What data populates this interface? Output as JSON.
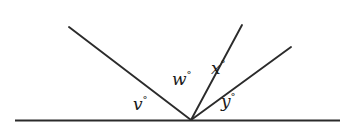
{
  "figure": {
    "type": "angle-diagram",
    "background_color": "#ffffff",
    "line_color": "#2b2b2b",
    "text_color": "#1a1a1a"
  },
  "labels": {
    "v": {
      "text": "v",
      "degree_symbol": "°"
    },
    "w": {
      "text": "w",
      "degree_symbol": "°"
    },
    "x": {
      "text": "x",
      "degree_symbol": "°"
    },
    "y": {
      "text": "y",
      "degree_symbol": "°"
    }
  },
  "chart_data": {
    "type": "diagram",
    "title": "",
    "vertex": {
      "x": 191,
      "y": 120
    },
    "baseline": {
      "x1": 15,
      "y1": 120.5,
      "x2": 340,
      "y2": 120.5
    },
    "rays": [
      {
        "name": "ray-upper-left",
        "x1": 191,
        "y1": 120,
        "x2": 69,
        "y2": 27,
        "bearing_deg": 142.7
      },
      {
        "name": "ray-steep-up-right",
        "x1": 191,
        "y1": 120,
        "x2": 242,
        "y2": 25,
        "bearing_deg": 61.8
      },
      {
        "name": "ray-shallow-up-right",
        "x1": 191,
        "y1": 120,
        "x2": 291,
        "y2": 47,
        "bearing_deg": 36.1
      }
    ],
    "angles": [
      {
        "label": "v",
        "between": [
          "baseline-left",
          "ray-upper-left"
        ],
        "value_deg": 37.3
      },
      {
        "label": "w",
        "between": [
          "ray-upper-left",
          "ray-steep-up-right"
        ],
        "value_deg": 80.9
      },
      {
        "label": "x",
        "between": [
          "ray-steep-up-right",
          "ray-shallow-up-right"
        ],
        "value_deg": 25.7
      },
      {
        "label": "y",
        "between": [
          "ray-shallow-up-right",
          "baseline-right"
        ],
        "value_deg": 36.1
      }
    ],
    "label_positions": [
      {
        "label": "v",
        "x": 133,
        "y": 95
      },
      {
        "label": "w",
        "x": 172,
        "y": 70
      },
      {
        "label": "x",
        "x": 211,
        "y": 59
      },
      {
        "label": "y",
        "x": 221,
        "y": 92
      }
    ],
    "xlabel": "",
    "ylabel": "",
    "grid": false,
    "legend": false
  }
}
